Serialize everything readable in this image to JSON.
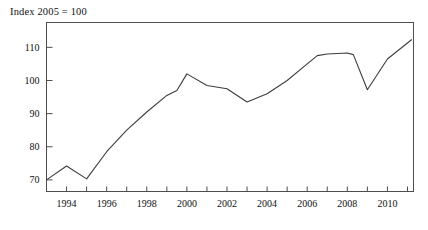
{
  "chart_data": {
    "type": "line",
    "title": "Index 2005 = 100",
    "xlabel": "",
    "ylabel": "",
    "grid": false,
    "legend": "none",
    "xlim": [
      1993.0,
      2011.3
    ],
    "ylim": [
      66.5,
      117.5
    ],
    "yticks": [
      70,
      80,
      90,
      100,
      110
    ],
    "ytick_labels": [
      "70",
      "80",
      "90",
      "100",
      "110"
    ],
    "xticks": [
      1994,
      1995,
      1996,
      1997,
      1998,
      1999,
      2000,
      2001,
      2002,
      2003,
      2004,
      2005,
      2006,
      2007,
      2008,
      2009,
      2010,
      2011
    ],
    "xtick_labels_major": [
      "1994",
      "1996",
      "1998",
      "2000",
      "2002",
      "2004",
      "2006",
      "2008",
      "2010"
    ],
    "xticks_major": [
      1994,
      1996,
      1998,
      2000,
      2002,
      2004,
      2006,
      2008,
      2010
    ],
    "series": [
      {
        "name": "index",
        "color": "#3d3d3d",
        "x": [
          1993.0,
          1994.0,
          1995.0,
          1996.0,
          1997.0,
          1998.0,
          1999.0,
          1999.5,
          2000.0,
          2001.0,
          2002.0,
          2003.0,
          2004.0,
          2005.0,
          2006.0,
          2006.5,
          2007.0,
          2008.0,
          2008.3,
          2009.0,
          2010.0,
          2011.2
        ],
        "values": [
          70.0,
          74.2,
          70.3,
          78.5,
          85.0,
          90.5,
          95.5,
          97.0,
          102.0,
          98.5,
          97.5,
          93.5,
          96.0,
          100.0,
          105.0,
          107.5,
          108.0,
          108.3,
          107.8,
          97.2,
          106.5,
          112.3
        ]
      }
    ]
  }
}
